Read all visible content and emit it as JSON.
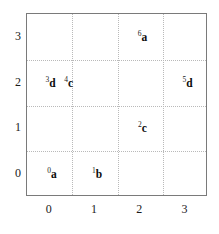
{
  "chart_data": {
    "type": "scatter",
    "title": "",
    "subtitle": "",
    "xlabel": "",
    "ylabel": "",
    "xlim": [
      -0.5,
      3.5
    ],
    "ylim": [
      -0.5,
      3.5
    ],
    "xticks": [
      "0",
      "1",
      "2",
      "3"
    ],
    "xtick_values": [
      0,
      1,
      2,
      3
    ],
    "yticks": [
      "0",
      "1",
      "2",
      "3"
    ],
    "ytick_values": [
      0,
      1,
      2,
      3
    ],
    "grid": true,
    "grid_style": "dotted",
    "grid_color": "#b9b9b9",
    "grid_x_values": [
      0.5,
      1.5,
      2.5
    ],
    "grid_y_values": [
      0.5,
      1.5,
      2.5
    ],
    "legend": "none",
    "frame_color": "#7a7a7a",
    "background_color": "#ffffff",
    "label_color": "#1a1a1a",
    "points": [
      {
        "index": "0",
        "letter": "a",
        "x": 0.05,
        "y": 0.0
      },
      {
        "index": "1",
        "letter": "b",
        "x": 1.05,
        "y": 0.0
      },
      {
        "index": "2",
        "letter": "c",
        "x": 2.05,
        "y": 1.0
      },
      {
        "index": "3",
        "letter": "d",
        "x": 0.02,
        "y": 2.0
      },
      {
        "index": "4",
        "letter": "c",
        "x": 0.42,
        "y": 2.0
      },
      {
        "index": "5",
        "letter": "d",
        "x": 3.05,
        "y": 2.0
      },
      {
        "index": "6",
        "letter": "a",
        "x": 2.05,
        "y": 3.0
      }
    ]
  }
}
